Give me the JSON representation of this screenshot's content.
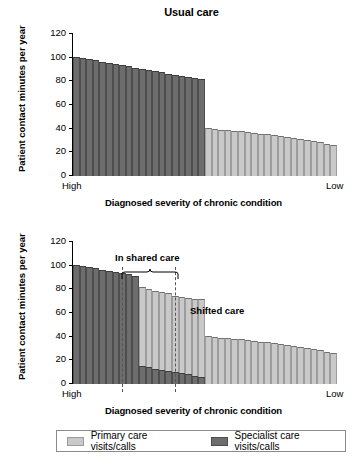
{
  "figure": {
    "ylabel": "Patient contact minutes per year",
    "xlabel": "Diagnosed severity of chronic condition",
    "x_start_label": "High",
    "x_end_label": "Low",
    "y_ticks": [
      "120",
      "100",
      "80",
      "60",
      "40",
      "20",
      "0"
    ]
  },
  "legend": {
    "primary_label": "Primary care visits/calls",
    "specialist_label": "Specialist care visits/calls",
    "primary_color": "#c9c9c9",
    "specialist_color": "#6d6d6d"
  },
  "annotations": {
    "in_shared_care": "In shared care",
    "shifted_care": "Shifted care"
  },
  "chart_data": [
    {
      "type": "bar",
      "title": "Usual care",
      "xlabel": "Diagnosed severity of chronic condition",
      "ylabel": "Patient contact minutes per year",
      "ylim": [
        0,
        120
      ],
      "yticks": [
        0,
        20,
        40,
        60,
        80,
        100,
        120
      ],
      "grid": false,
      "legend_position": "below-figure",
      "x_axis_direction": "High severity (left) to Low severity (right)",
      "series": [
        {
          "name": "Specialist care visits/calls",
          "color": "#6d6d6d",
          "values": [
            100,
            99,
            98,
            97,
            96,
            95,
            94,
            93,
            92,
            91,
            90,
            89,
            88,
            87,
            86,
            85,
            84,
            83,
            82,
            81,
            0,
            0,
            0,
            0,
            0,
            0,
            0,
            0,
            0,
            0,
            0,
            0,
            0,
            0,
            0,
            0,
            0,
            0,
            0,
            0
          ]
        },
        {
          "name": "Primary care visits/calls",
          "color": "#c9c9c9",
          "values": [
            0,
            0,
            0,
            0,
            0,
            0,
            0,
            0,
            0,
            0,
            0,
            0,
            0,
            0,
            0,
            0,
            0,
            0,
            0,
            0,
            40,
            39.5,
            39,
            38.5,
            38,
            37.5,
            37,
            36,
            35.5,
            35,
            34,
            33.5,
            33,
            32,
            31,
            30.5,
            29.5,
            28.5,
            27,
            26
          ]
        }
      ]
    },
    {
      "type": "bar",
      "title": "",
      "xlabel": "Diagnosed severity of chronic condition",
      "ylabel": "Patient contact minutes per year",
      "ylim": [
        0,
        120
      ],
      "yticks": [
        0,
        20,
        40,
        60,
        80,
        100,
        120
      ],
      "grid": false,
      "legend_position": "below-figure",
      "x_axis_direction": "High severity (left) to Low severity (right)",
      "annotations": [
        {
          "text": "In shared care",
          "span_start_bar": 10,
          "span_end_bar": 20,
          "type": "brace"
        },
        {
          "text": "Shifted care",
          "span_start_bar": 21,
          "span_end_bar": 40,
          "type": "label"
        }
      ],
      "series": [
        {
          "name": "Specialist care visits/calls",
          "color": "#6d6d6d",
          "values": [
            100,
            99,
            98,
            97,
            96,
            95,
            94,
            93,
            92,
            91,
            15,
            14,
            13,
            12,
            11,
            10,
            9,
            8,
            7,
            6,
            0,
            0,
            0,
            0,
            0,
            0,
            0,
            0,
            0,
            0,
            0,
            0,
            0,
            0,
            0,
            0,
            0,
            0,
            0,
            0
          ]
        },
        {
          "name": "Primary care visits/calls",
          "color": "#c9c9c9",
          "values": [
            0,
            0,
            0,
            0,
            0,
            0,
            0,
            0,
            0,
            0,
            66,
            66,
            65,
            65,
            65,
            64,
            64,
            64,
            64,
            65,
            40,
            39.5,
            39,
            38.5,
            38,
            37.5,
            37,
            36,
            35.5,
            35,
            34,
            33.5,
            33,
            32,
            31,
            30.5,
            29.5,
            28.5,
            27,
            26
          ]
        }
      ]
    }
  ]
}
